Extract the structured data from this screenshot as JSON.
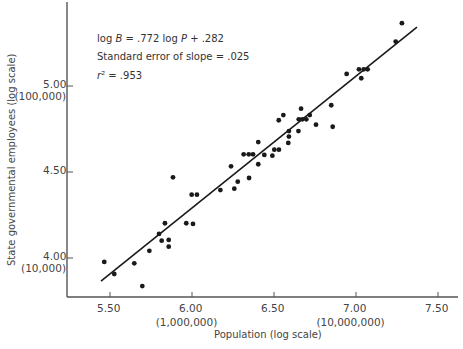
{
  "chart_data": {
    "type": "scatter",
    "title": "",
    "xlabel": "Population (log scale)",
    "ylabel": "State governmental employees (log scale)",
    "xlim": [
      5.27,
      7.6
    ],
    "ylim": [
      3.77,
      5.5
    ],
    "grid": false,
    "x_ticks": [
      {
        "value": 5.5,
        "label": "5.50",
        "sublabel": ""
      },
      {
        "value": 6.0,
        "label": "6.00",
        "sublabel": "(1,000,000)"
      },
      {
        "value": 6.5,
        "label": "6.50",
        "sublabel": ""
      },
      {
        "value": 7.0,
        "label": "7.00",
        "sublabel": "(10,000,000)"
      },
      {
        "value": 7.5,
        "label": "7.50",
        "sublabel": ""
      }
    ],
    "y_ticks": [
      {
        "value": 4.0,
        "label": "4.00",
        "sublabel": "(10,000)"
      },
      {
        "value": 4.5,
        "label": "4.50",
        "sublabel": ""
      },
      {
        "value": 5.0,
        "label": "5.00",
        "sublabel": "(100,000)"
      }
    ],
    "annotations": [
      "log B = .772 log P + .282",
      "Standard error of slope = .025",
      "r² = .953"
    ],
    "regression": {
      "slope": 0.772,
      "intercept": 0.282,
      "slope_std_error": 0.025,
      "r_squared": 0.953,
      "drawn_from": [
        5.445,
        3.866
      ],
      "drawn_to": [
        7.372,
        5.343
      ]
    },
    "series": [
      {
        "name": "States",
        "points": [
          [
            5.465,
            3.977
          ],
          [
            5.526,
            3.907
          ],
          [
            5.648,
            3.969
          ],
          [
            5.697,
            3.837
          ],
          [
            5.74,
            4.042
          ],
          [
            5.799,
            4.14
          ],
          [
            5.835,
            4.202
          ],
          [
            5.815,
            4.101
          ],
          [
            5.858,
            4.105
          ],
          [
            5.858,
            4.066
          ],
          [
            5.884,
            4.469
          ],
          [
            5.965,
            4.202
          ],
          [
            6.006,
            4.198
          ],
          [
            5.998,
            4.368
          ],
          [
            6.03,
            4.368
          ],
          [
            6.173,
            4.395
          ],
          [
            6.258,
            4.403
          ],
          [
            6.279,
            4.444
          ],
          [
            6.238,
            4.533
          ],
          [
            6.348,
            4.465
          ],
          [
            6.315,
            4.603
          ],
          [
            6.346,
            4.603
          ],
          [
            6.372,
            4.603
          ],
          [
            6.404,
            4.674
          ],
          [
            6.404,
            4.545
          ],
          [
            6.441,
            4.599
          ],
          [
            6.49,
            4.595
          ],
          [
            6.502,
            4.63
          ],
          [
            6.53,
            4.63
          ],
          [
            6.529,
            4.801
          ],
          [
            6.557,
            4.831
          ],
          [
            6.591,
            4.738
          ],
          [
            6.591,
            4.706
          ],
          [
            6.587,
            4.669
          ],
          [
            6.649,
            4.738
          ],
          [
            6.665,
            4.868
          ],
          [
            6.651,
            4.806
          ],
          [
            6.673,
            4.806
          ],
          [
            6.697,
            4.806
          ],
          [
            6.718,
            4.831
          ],
          [
            6.756,
            4.775
          ],
          [
            6.849,
            4.888
          ],
          [
            6.858,
            4.763
          ],
          [
            6.943,
            5.07
          ],
          [
            7.018,
            5.097
          ],
          [
            7.032,
            5.045
          ],
          [
            7.047,
            5.097
          ],
          [
            7.071,
            5.097
          ],
          [
            7.242,
            5.258
          ],
          [
            7.28,
            5.365
          ]
        ]
      }
    ],
    "colors": {
      "axis": "#555555",
      "points": "#1a1a1a",
      "line": "#1a1a1a"
    }
  }
}
